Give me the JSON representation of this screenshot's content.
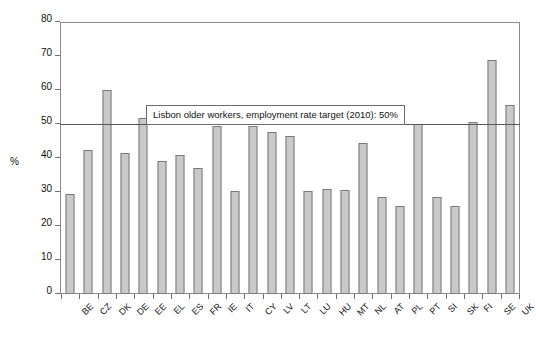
{
  "chart_data": {
    "type": "bar",
    "title": "",
    "xlabel": "",
    "ylabel": "%",
    "ylim": [
      0,
      80
    ],
    "yticks": [
      0,
      10,
      20,
      30,
      40,
      50,
      60,
      70,
      80
    ],
    "grid": false,
    "legend": null,
    "categories": [
      "BE",
      "CZ",
      "DK",
      "DE",
      "EE",
      "EL",
      "ES",
      "FR",
      "IE",
      "IT",
      "CY",
      "LV",
      "LT",
      "LU",
      "HU",
      "MT",
      "NL",
      "AT",
      "PL",
      "PT",
      "SI",
      "SK",
      "FI",
      "SE",
      "UK"
    ],
    "values": [
      29.5,
      42.3,
      59.9,
      41.5,
      51.9,
      39.1,
      40.8,
      37.0,
      49.3,
      30.4,
      49.4,
      47.7,
      46.6,
      30.4,
      30.8,
      30.7,
      44.4,
      28.4,
      26.0,
      50.1,
      28.5,
      26.0,
      50.6,
      68.8,
      55.6
    ],
    "annotations": [
      {
        "name": "lisbon-target",
        "text": "Lisbon older workers, employment rate target (2010): 50%",
        "value": 50,
        "kind": "horizontal-reference-line"
      }
    ],
    "bar_fill_color": "#c9c9c9",
    "bar_border_color": "#7a7a7a",
    "reference_line_color": "#555555",
    "axis_color": "#8c8c8c"
  },
  "caption": {
    "text": ""
  }
}
